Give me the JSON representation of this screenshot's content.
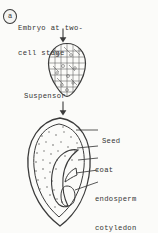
{
  "figure": {
    "badge_letter": "a",
    "caption_line_1": "Embryo at two-",
    "caption_line_2": "cell stage",
    "suspensor_label": "Suspensor",
    "arrow_top_name": "down-arrow-icon",
    "arrow_bottom_name": "down-arrow-icon",
    "embryo_shape_name": "two-cell-embryo-drawing",
    "seed_shape_name": "seed-cross-section-drawing"
  },
  "seed_labels": [
    {
      "text": "Seed",
      "indent": true,
      "has_leader": false
    },
    {
      "text": "coat",
      "indent": false,
      "has_leader": true
    },
    {
      "text": "endosperm",
      "indent": false,
      "has_leader": true
    },
    {
      "text": "cotyledon",
      "indent": false,
      "has_leader": true
    },
    {
      "text": "epicotyl",
      "indent": false,
      "has_leader": true
    },
    {
      "text": "hypocotyl",
      "indent": false,
      "has_leader": true
    }
  ],
  "colors": {
    "background": "#fbfbf9",
    "ink": "#3b3b3b",
    "text": "#343434"
  }
}
